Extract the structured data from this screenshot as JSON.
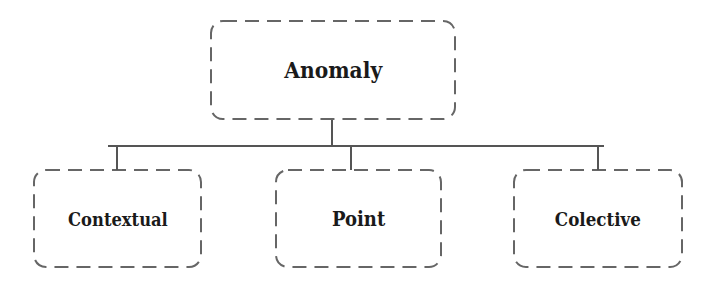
{
  "diagram": {
    "type": "hierarchy",
    "root": {
      "label": "Anomaly"
    },
    "children": [
      {
        "label": "Contextual"
      },
      {
        "label": "Point"
      },
      {
        "label": "Colective"
      }
    ],
    "colors": {
      "border": "#666666",
      "connector": "#555555",
      "text": "#1a1a1a",
      "background": "#ffffff"
    }
  }
}
